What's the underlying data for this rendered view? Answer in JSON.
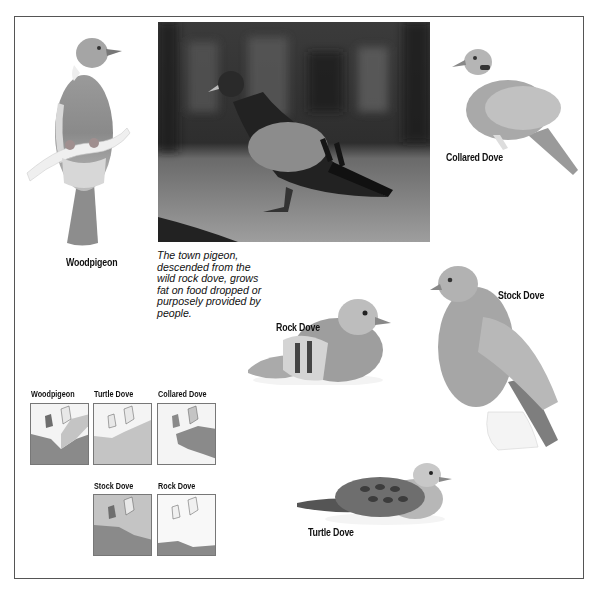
{
  "page": {
    "frame_color": "#555555"
  },
  "photo": {
    "subject": "town pigeon photograph",
    "caption": "The town pigeon, descended from the wild rock dove, grows fat on food dropped or purposely provided by people.",
    "caption_lines": [
      "The town pigeon,",
      "descended from the",
      "wild rock dove, grows",
      "fat on food dropped or",
      "purposely provided by",
      "people."
    ]
  },
  "birds": [
    {
      "id": "woodpigeon",
      "label": "Woodpigeon"
    },
    {
      "id": "collared-dove",
      "label": "Collared Dove"
    },
    {
      "id": "rock-dove",
      "label": "Rock Dove"
    },
    {
      "id": "stock-dove",
      "label": "Stock Dove"
    },
    {
      "id": "turtle-dove",
      "label": "Turtle Dove"
    }
  ],
  "maps": [
    {
      "id": "woodpigeon",
      "label": "Woodpigeon",
      "range_desc": "west and central Europe dark, east lighter"
    },
    {
      "id": "turtle-dove",
      "label": "Turtle Dove",
      "range_desc": "most of Europe except Britain north"
    },
    {
      "id": "collared-dove",
      "label": "Collared Dove",
      "range_desc": "central and eastern Europe"
    },
    {
      "id": "stock-dove",
      "label": "Stock Dove",
      "range_desc": "west and central Europe"
    },
    {
      "id": "rock-dove",
      "label": "Rock Dove",
      "range_desc": "Mediterranean coasts"
    }
  ],
  "colors": {
    "map_range_dark": "#8a8a8a",
    "map_range_light": "#c4c4c4",
    "map_land": "#f4f4f4",
    "map_sea": "#ffffff",
    "map_outline": "#555555"
  }
}
